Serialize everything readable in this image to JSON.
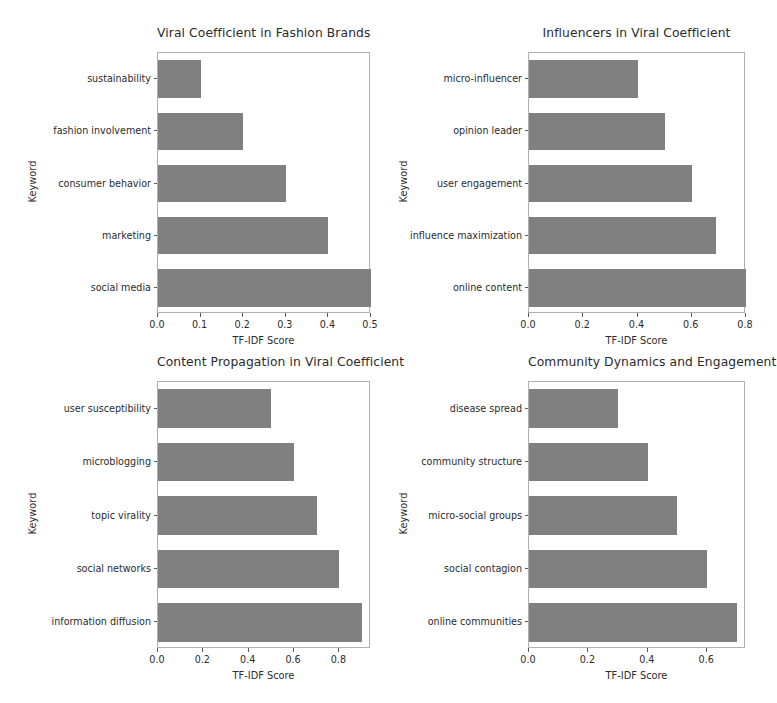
{
  "figure": {
    "width": 777,
    "height": 703,
    "background": "#ffffff",
    "bar_color": "#808080",
    "axis_color": "#b0b0b0",
    "text_color": "#2b2b2b",
    "layout": "2x2 grid of horizontal bar charts"
  },
  "chart_data": [
    {
      "type": "bar",
      "orientation": "horizontal",
      "title": "Viral Coefficient in Fashion Brands",
      "xlabel": "TF-IDF Score",
      "ylabel": "Keyword",
      "categories": [
        "sustainability",
        "fashion involvement",
        "consumer behavior",
        "marketing",
        "social media"
      ],
      "values": [
        0.1,
        0.2,
        0.3,
        0.4,
        0.5
      ],
      "xticks": [
        "0.0",
        "0.1",
        "0.2",
        "0.3",
        "0.4",
        "0.5"
      ],
      "xtick_values": [
        0.0,
        0.1,
        0.2,
        0.3,
        0.4,
        0.5
      ],
      "xlim": [
        0.0,
        0.5
      ],
      "grid": false,
      "legend": "none"
    },
    {
      "type": "bar",
      "orientation": "horizontal",
      "title": "Influencers in Viral Coefficient",
      "xlabel": "TF-IDF Score",
      "ylabel": "Keyword",
      "categories": [
        "micro-influencer",
        "opinion leader",
        "user engagement",
        "influence maximization",
        "online content"
      ],
      "values": [
        0.4,
        0.5,
        0.6,
        0.69,
        0.8
      ],
      "xticks": [
        "0.0",
        "0.2",
        "0.4",
        "0.6",
        "0.8"
      ],
      "xtick_values": [
        0.0,
        0.2,
        0.4,
        0.6,
        0.8
      ],
      "xlim": [
        0.0,
        0.8
      ],
      "grid": false,
      "legend": "none"
    },
    {
      "type": "bar",
      "orientation": "horizontal",
      "title": "Content Propagation in Viral Coefficient",
      "xlabel": "TF-IDF Score",
      "ylabel": "Keyword",
      "categories": [
        "user susceptibility",
        "microblogging",
        "topic virality",
        "social networks",
        "information diffusion"
      ],
      "values": [
        0.5,
        0.6,
        0.7,
        0.8,
        0.9
      ],
      "xticks": [
        "0.0",
        "0.2",
        "0.4",
        "0.6",
        "0.8"
      ],
      "xtick_values": [
        0.0,
        0.2,
        0.4,
        0.6,
        0.8
      ],
      "xlim": [
        0.0,
        0.9394
      ],
      "grid": false,
      "legend": "none"
    },
    {
      "type": "bar",
      "orientation": "horizontal",
      "title": "Community Dynamics and Engagement",
      "xlabel": "TF-IDF Score",
      "ylabel": "Keyword",
      "categories": [
        "disease spread",
        "community structure",
        "micro-social groups",
        "social contagion",
        "online communities"
      ],
      "values": [
        0.3,
        0.4,
        0.5,
        0.6,
        0.7
      ],
      "xticks": [
        "0.0",
        "0.2",
        "0.4",
        "0.6"
      ],
      "xtick_values": [
        0.0,
        0.2,
        0.4,
        0.6
      ],
      "xlim": [
        0.0,
        0.7308
      ],
      "grid": false,
      "legend": "none"
    }
  ],
  "panel_geometry": [
    {
      "left": 157,
      "top": 52,
      "width": 213,
      "height": 261,
      "title_top": 26
    },
    {
      "left": 528,
      "top": 52,
      "width": 217,
      "height": 261,
      "title_top": 26
    },
    {
      "left": 157,
      "top": 381,
      "width": 213,
      "height": 267,
      "title_top": 355
    },
    {
      "left": 528,
      "top": 381,
      "width": 217,
      "height": 267,
      "title_top": 355
    }
  ]
}
